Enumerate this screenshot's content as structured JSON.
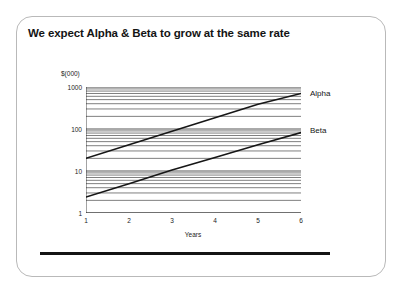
{
  "slide": {
    "title": "We expect Alpha & Beta to grow at the same rate"
  },
  "chart_data": {
    "type": "line",
    "title": "We expect Alpha & Beta to grow at the same rate",
    "xlabel": "Years",
    "ylabel": "$(000)",
    "yscale": "log",
    "xlim": [
      1,
      6
    ],
    "ylim": [
      1,
      1000
    ],
    "grid": true,
    "grid_style": "horizontal-log-minor",
    "legend": "right-inline-labels",
    "x": [
      1,
      2,
      3,
      4,
      5,
      6
    ],
    "x_tick_labels": [
      "1",
      "2",
      "3",
      "4",
      "5",
      "6"
    ],
    "y_tick_labels": [
      "1",
      "10",
      "100",
      "1000"
    ],
    "y_ticks": [
      1,
      10,
      100,
      1000
    ],
    "series": [
      {
        "name": "Alpha",
        "color": "#161616",
        "values": [
          20,
          42,
          88,
          185,
          390,
          700
        ]
      },
      {
        "name": "Beta",
        "color": "#161616",
        "values": [
          2.4,
          5.0,
          10.5,
          21,
          42,
          82
        ]
      }
    ]
  },
  "axes": {
    "y_unit_label": "$(000)",
    "x_title": "Years"
  }
}
